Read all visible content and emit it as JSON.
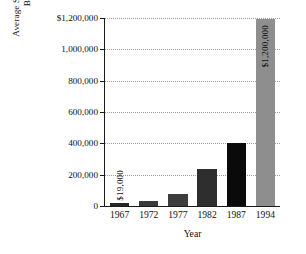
{
  "chart_data": {
    "type": "bar",
    "title": "",
    "xlabel": "Year",
    "ylabel_lines": [
      "Average Salary of Major League",
      "Baseball Players"
    ],
    "ylabel": "Average Salary of Major League Baseball Players",
    "categories": [
      "1967",
      "1972",
      "1977",
      "1982",
      "1987",
      "1994"
    ],
    "values": [
      19000,
      30000,
      75000,
      240000,
      405000,
      1200000
    ],
    "bar_labels": [
      "$19,000",
      "",
      "",
      "",
      "",
      "$1,200,000"
    ],
    "bar_colors": [
      "#262626",
      "#3a3a3a",
      "#3c3c3c",
      "#2e2e2e",
      "#0a0a0a",
      "#8e8e8e"
    ],
    "ylim": [
      0,
      1200000
    ],
    "ytick_values": [
      0,
      200000,
      400000,
      600000,
      800000,
      1000000,
      1200000
    ],
    "ytick_labels": [
      "0",
      "200,000",
      "400,000",
      "600,000",
      "800,000",
      "1,000,000",
      "$1,200,000"
    ],
    "grid": true,
    "grid_style": "dotted",
    "legend": "none",
    "axis_color": "#1a1a1a",
    "grid_color": "#9a9a9a",
    "background": "#ffffff"
  }
}
